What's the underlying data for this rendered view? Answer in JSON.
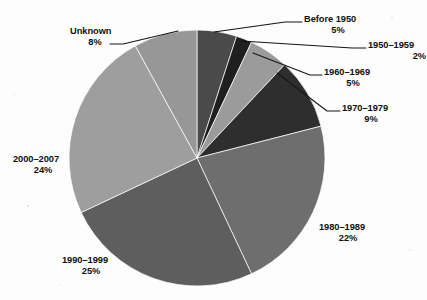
{
  "chart_data": {
    "type": "pie",
    "title": "",
    "subtitle": "",
    "xlabel": "",
    "ylabel": "",
    "legend_position": "callout-labels",
    "grid": false,
    "start_angle_deg": 0,
    "direction": "clockwise",
    "categories": [
      "Before 1950",
      "1950–1959",
      "1960–1969",
      "1970–1979",
      "1980–1989",
      "1990–1999",
      "2000–2007",
      "Unknown"
    ],
    "values": [
      5,
      2,
      5,
      9,
      22,
      25,
      24,
      8
    ],
    "value_labels": [
      "5%",
      "2%",
      "5%",
      "9%",
      "22%",
      "25%",
      "24%",
      "8%"
    ],
    "units": "percent",
    "colors": [
      "#4a4a4a",
      "#1f1f1f",
      "#9b9b9b",
      "#2e2e2e",
      "#6e6e6e",
      "#5e5e5e",
      "#9e9e9e",
      "#979797"
    ],
    "slices": [
      {
        "name": "Before 1950",
        "value": 5,
        "percent_label": "5%",
        "color": "#4a4a4a"
      },
      {
        "name": "1950–1959",
        "value": 2,
        "percent_label": "2%",
        "color": "#1f1f1f"
      },
      {
        "name": "1960–1969",
        "value": 5,
        "percent_label": "5%",
        "color": "#9b9b9b"
      },
      {
        "name": "1970–1979",
        "value": 9,
        "percent_label": "9%",
        "color": "#2e2e2e"
      },
      {
        "name": "1980–1989",
        "value": 22,
        "percent_label": "22%",
        "color": "#6e6e6e"
      },
      {
        "name": "1990–1999",
        "value": 25,
        "percent_label": "25%",
        "color": "#5e5e5e"
      },
      {
        "name": "2000–2007",
        "value": 24,
        "percent_label": "24%",
        "color": "#9e9e9e"
      },
      {
        "name": "Unknown",
        "value": 8,
        "percent_label": "8%",
        "color": "#979797"
      }
    ]
  },
  "geometry": {
    "center_x": 197,
    "center_y": 158,
    "radius": 128
  },
  "labels": {
    "before_1950": {
      "name": "Before 1950",
      "pct": "5%"
    },
    "y1950_1959": {
      "name": "1950–1959",
      "pct": "2%"
    },
    "y1960_1969": {
      "name": "1960–1969",
      "pct": "5%"
    },
    "y1970_1979": {
      "name": "1970–1979",
      "pct": "9%"
    },
    "y1980_1989": {
      "name": "1980–1989",
      "pct": "22%"
    },
    "y1990_1999": {
      "name": "1990–1999",
      "pct": "25%"
    },
    "y2000_2007": {
      "name": "2000–2007",
      "pct": "24%"
    },
    "unknown": {
      "name": "Unknown",
      "pct": "8%"
    }
  }
}
